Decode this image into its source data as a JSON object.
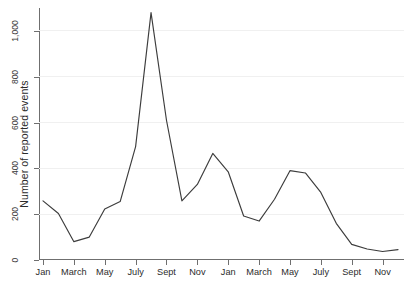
{
  "chart_data": {
    "type": "line",
    "title": "",
    "subtitle": "",
    "xlabel": "",
    "ylabel": "Number of reported events",
    "ylim": [
      0,
      1100
    ],
    "yticks": [
      0,
      200,
      400,
      600,
      800,
      1000
    ],
    "ytick_labels": [
      "0",
      "200",
      "400",
      "600",
      "800",
      "1,000"
    ],
    "grid": true,
    "grid_axis": "y",
    "legend": false,
    "legend_position": "none",
    "line_color": "#3c3c3c",
    "background_color": "#ffffff",
    "gridline_color": "#f0f0f0",
    "axis_color": "#6f6f6f",
    "x": [
      1,
      2,
      3,
      4,
      5,
      6,
      7,
      8,
      9,
      10,
      11,
      12,
      13,
      14,
      15,
      16,
      17,
      18,
      19,
      20,
      21,
      22,
      23,
      24
    ],
    "xtick_positions": [
      1,
      3,
      5,
      7,
      9,
      11,
      13,
      15,
      17,
      19,
      21,
      23
    ],
    "xtick_labels": [
      "Jan",
      "March",
      "May",
      "July",
      "Sept",
      "Nov",
      "Jan",
      "March",
      "May",
      "July",
      "Sept",
      "Nov"
    ],
    "categories": [
      "Jan Y1",
      "Feb Y1",
      "March Y1",
      "April Y1",
      "May Y1",
      "June Y1",
      "July Y1",
      "Aug Y1",
      "Sept Y1",
      "Oct Y1",
      "Nov Y1",
      "Dec Y1",
      "Jan Y2",
      "Feb Y2",
      "March Y2",
      "April Y2",
      "May Y2",
      "June Y2",
      "July Y2",
      "Aug Y2",
      "Sept Y2",
      "Oct Y2",
      "Nov Y2",
      "Dec Y2"
    ],
    "values": [
      258,
      203,
      80,
      100,
      223,
      255,
      495,
      1080,
      610,
      258,
      330,
      465,
      385,
      192,
      170,
      265,
      390,
      380,
      295,
      160,
      68,
      48,
      37,
      45
    ],
    "series": [
      {
        "name": "Number of reported events",
        "values": [
          258,
          203,
          80,
          100,
          223,
          255,
          495,
          1080,
          610,
          258,
          330,
          465,
          385,
          192,
          170,
          265,
          390,
          380,
          295,
          160,
          68,
          48,
          37,
          45
        ]
      }
    ],
    "annotations": []
  }
}
